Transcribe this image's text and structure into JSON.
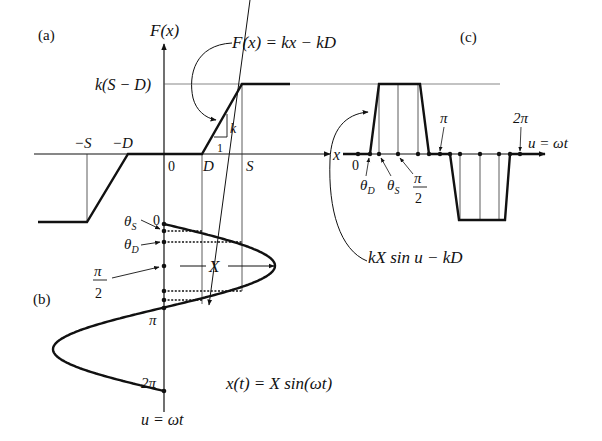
{
  "figure": {
    "panel_labels": {
      "a": "(a)",
      "b": "(b)",
      "c": "(c)"
    },
    "panel_a": {
      "y_axis_label": "F(x)",
      "x_axis_label": "x",
      "level_label": "k(S − D)",
      "tick_labels": {
        "neg_s": "−S",
        "neg_d": "−D",
        "zero": "0",
        "d": "D",
        "s": "S"
      },
      "slope_labels": {
        "rise": "k",
        "run": "1"
      },
      "equation": "F(x) = kx − kD"
    },
    "panel_b": {
      "angle_labels": {
        "zero": "0",
        "theta_s": "θS",
        "theta_d": "θD",
        "half_pi_num": "π",
        "half_pi_den": "2",
        "pi": "π",
        "two_pi": "2π"
      },
      "amplitude_label": "X",
      "axis_label": "u = ωt",
      "equation": "x(t) = X sin(ωt)"
    },
    "panel_c": {
      "axis_label": "u = ωt",
      "tick_labels": {
        "zero": "0",
        "theta_d": "θD",
        "theta_s": "θS",
        "half_pi_num": "π",
        "half_pi_den": "2",
        "pi": "π",
        "two_pi": "2π"
      },
      "equation": "kX sin u − kD"
    },
    "colors": {
      "ink": "#111111",
      "background": "#ffffff"
    }
  }
}
